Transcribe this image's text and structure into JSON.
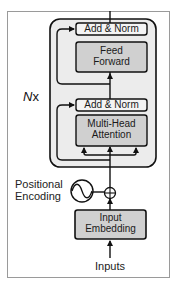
{
  "top_caption_partial": "",
  "diagram": {
    "repeat_label": {
      "prefix": "N",
      "suffix": "x"
    },
    "blocks": [
      {
        "id": "add-norm-top",
        "label": "Add & Norm"
      },
      {
        "id": "feed-forward",
        "label_line1": "Feed",
        "label_line2": "Forward"
      },
      {
        "id": "add-norm-bottom",
        "label": "Add & Norm"
      },
      {
        "id": "multi-head-attention",
        "label_line1": "Multi-Head",
        "label_line2": "Attention"
      },
      {
        "id": "input-embedding",
        "label_line1": "Input",
        "label_line2": "Embedding"
      }
    ],
    "positional_encoding": {
      "label_line1": "Positional",
      "label_line2": "Encoding"
    },
    "input_label": "Inputs",
    "colors": {
      "frame_border": "#9a9a9a",
      "encoder_block_fill": "#ececec",
      "sublayer_fill": "#d0d0d0",
      "norm_fill": "#f4f4f4",
      "stroke": "#111111"
    }
  }
}
